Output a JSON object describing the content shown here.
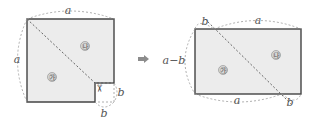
{
  "colors": {
    "fill": "#ececec",
    "edge": "#444444",
    "dashed": "#9a9a9a",
    "arrow": "#8c8c8c",
    "label": "#555555"
  },
  "left_figure": {
    "label_top": "a",
    "label_left": "a",
    "label_corner_right": "b",
    "label_corner_bottom": "b",
    "piece_upper": "㉯",
    "piece_lower": "㉮",
    "scissors_icon": "✂"
  },
  "arrow": "➡",
  "right_figure": {
    "label_top_b": "b",
    "label_top_a": "a",
    "label_left": "a−b",
    "label_bottom_a": "a",
    "label_bottom_b": "b",
    "piece_upper": "㉯",
    "piece_lower": "㉮"
  }
}
